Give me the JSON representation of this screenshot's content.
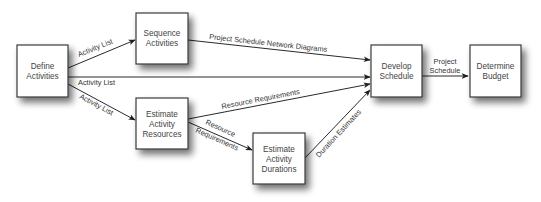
{
  "diagram": {
    "type": "process-flow",
    "nodes": [
      {
        "id": "define",
        "lines": [
          "Define",
          "Activities"
        ],
        "x": 17,
        "y": 45,
        "w": 51,
        "h": 52
      },
      {
        "id": "sequence",
        "lines": [
          "Sequence",
          "Activities"
        ],
        "x": 136,
        "y": 13,
        "w": 52,
        "h": 51
      },
      {
        "id": "resources",
        "lines": [
          "Estimate",
          "Activity",
          "Resources"
        ],
        "x": 136,
        "y": 98,
        "w": 52,
        "h": 51
      },
      {
        "id": "durations",
        "lines": [
          "Estimate",
          "Activity",
          "Durations"
        ],
        "x": 253,
        "y": 133,
        "w": 52,
        "h": 51
      },
      {
        "id": "develop",
        "lines": [
          "Develop",
          "Schedule"
        ],
        "x": 371,
        "y": 45,
        "w": 51,
        "h": 52
      },
      {
        "id": "budget",
        "lines": [
          "Determine",
          "Budget"
        ],
        "x": 470,
        "y": 45,
        "w": 51,
        "h": 52
      }
    ],
    "edges": [
      {
        "id": "define-sequence",
        "from": "define",
        "to": "sequence",
        "label": "Activity List"
      },
      {
        "id": "define-develop",
        "from": "define",
        "to": "develop",
        "label": "Activity List"
      },
      {
        "id": "define-resources",
        "from": "define",
        "to": "resources",
        "label": "Activity List"
      },
      {
        "id": "sequence-develop",
        "from": "sequence",
        "to": "develop",
        "label": "Project Schedule Network Diagrams"
      },
      {
        "id": "resources-develop",
        "from": "resources",
        "to": "develop",
        "label": "Resource Requirements"
      },
      {
        "id": "resources-durations",
        "from": "resources",
        "to": "durations",
        "label_lines": [
          "Resource",
          "Requirements"
        ]
      },
      {
        "id": "durations-develop",
        "from": "durations",
        "to": "develop",
        "label": "Duration Estimates"
      },
      {
        "id": "develop-budget",
        "from": "develop",
        "to": "budget",
        "label_lines": [
          "Project",
          "Schedule"
        ]
      }
    ]
  },
  "colors": {
    "box_stroke": "#3a3a3a",
    "box_fill": "#ffffff",
    "shadow": "#000000",
    "line": "#2a2a2a",
    "text": "#444444"
  }
}
